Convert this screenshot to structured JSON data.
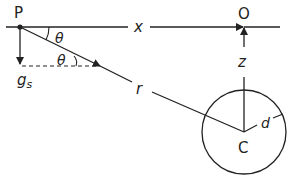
{
  "diagram": {
    "points": {
      "P": {
        "label": "P",
        "x": 20,
        "y": 27
      },
      "O": {
        "label": "O",
        "x": 244,
        "y": 27
      },
      "C": {
        "label": "C",
        "x": 244,
        "y": 132
      }
    },
    "labels": {
      "x": "x",
      "z": "z",
      "r": "r",
      "d": "d",
      "theta_top": "θ",
      "theta_bottom": "θ",
      "g": "g",
      "g_sub": "s"
    },
    "circle": {
      "cx": 244,
      "cy": 132,
      "radius": 42
    },
    "colors": {
      "stroke": "#222222",
      "background": "#ffffff"
    }
  }
}
